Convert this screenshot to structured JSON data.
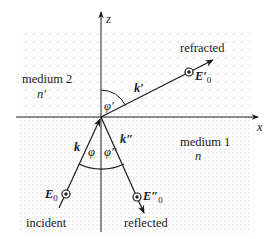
{
  "diagram": {
    "axes": {
      "z_label": "z",
      "x_label": "x"
    },
    "media": {
      "upper": {
        "name": "medium 2",
        "index": "n′"
      },
      "lower": {
        "name": "medium 1",
        "index": "n"
      }
    },
    "waves": {
      "incident": {
        "label": "incident",
        "wavevector": "k",
        "field": "E",
        "field_sub": "0",
        "angle": "φ"
      },
      "reflected": {
        "label": "reflected",
        "wavevector": "k″",
        "field": "E″",
        "field_sub": "0",
        "angle": "φ″"
      },
      "refracted": {
        "label": "refracted",
        "wavevector": "k′",
        "field": "E′",
        "field_sub": "0",
        "angle": "φ′"
      }
    },
    "colors": {
      "ink": "#1a1a1a",
      "dots": "#9a9a9a",
      "background": "#ffffff"
    }
  }
}
